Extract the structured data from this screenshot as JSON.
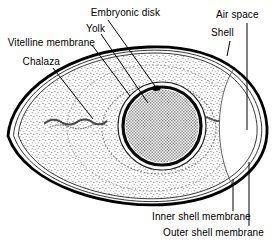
{
  "figure": {
    "kind": "egg-anatomy-diagram",
    "background_color": "#ffffff",
    "ink_color": "#000000",
    "yolk_fill_color": "#8f8f8f"
  },
  "labels": {
    "embryonic_disk": "Embryonic disk",
    "yolk": "Yolk",
    "vitelline_membrane": "Vitelline membrane",
    "chalaza": "Chalaza",
    "air_space": "Air space",
    "shell": "Shell",
    "inner_shell_membrane": "Inner shell membrane",
    "outer_shell_membrane": "Outer shell membrane"
  }
}
